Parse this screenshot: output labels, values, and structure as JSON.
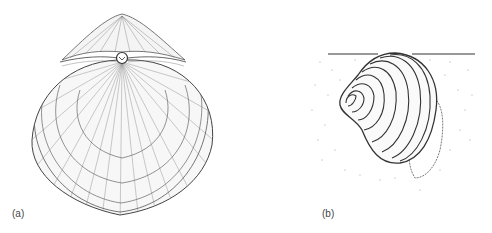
{
  "figure": {
    "panels": [
      {
        "id": "a",
        "label": "(a)",
        "subject": "bivalve shell, dorsal view with radial ribs and concentric growth lines"
      },
      {
        "id": "b",
        "label": "(b)",
        "subject": "bivalve shell buried in sediment below surface line, with siphon"
      }
    ],
    "colors": {
      "ink": "#3a3a3a",
      "background": "#ffffff",
      "stipple": "#999999"
    }
  }
}
